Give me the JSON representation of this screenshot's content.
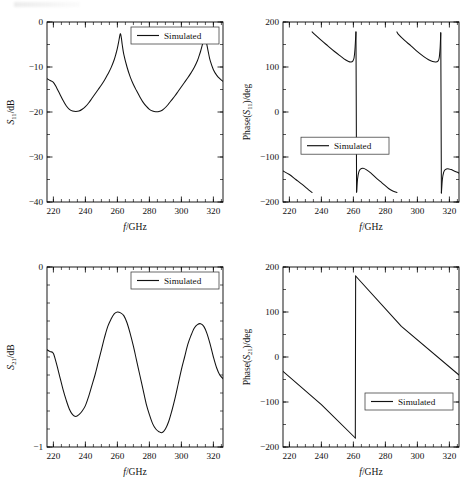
{
  "figure": {
    "panel_count": 4,
    "line_color": "#111111",
    "background": "#ffffff"
  },
  "legend_label": "Simulated",
  "axis_x_label": "f/GHz",
  "chart_data": [
    {
      "id": "s11-magnitude",
      "position": "top-left",
      "type": "line",
      "title": "",
      "xlabel": "f/GHz",
      "ylabel": "S11/dB",
      "ylabel_base": "S",
      "ylabel_sub": "11",
      "ylabel_unit": "/dB",
      "xlim": [
        216,
        326
      ],
      "ylim": [
        -40,
        0
      ],
      "xticks": [
        220,
        240,
        260,
        280,
        300,
        320
      ],
      "yticks": [
        0,
        -10,
        -20,
        -30,
        -40
      ],
      "xminor_step": 5,
      "yminor_step": 5,
      "grid": false,
      "legend": [
        "Simulated"
      ],
      "legend_position": "top-right",
      "series": [
        {
          "name": "Simulated",
          "x": [
            216,
            218,
            220,
            222,
            224,
            226,
            228,
            230,
            232,
            234,
            236,
            238,
            240,
            242,
            244,
            246,
            248,
            250,
            252,
            254,
            256,
            258,
            259,
            260,
            261,
            261.8,
            262.5,
            263,
            264,
            266,
            268,
            270,
            272,
            274,
            276,
            278,
            280,
            282,
            284,
            286,
            288,
            290,
            292,
            294,
            296,
            298,
            300,
            302,
            304,
            306,
            308,
            310,
            311,
            312,
            313,
            314,
            314.8,
            315.5,
            316,
            317,
            318,
            320,
            322,
            324,
            326
          ],
          "y": [
            -12.6,
            -13.0,
            -13.4,
            -14.6,
            -16.0,
            -17.4,
            -18.6,
            -19.4,
            -19.8,
            -19.9,
            -19.8,
            -19.4,
            -18.8,
            -18.0,
            -17.0,
            -16.0,
            -15.0,
            -14.0,
            -12.9,
            -11.6,
            -10.2,
            -8.4,
            -7.2,
            -5.8,
            -4.0,
            -2.6,
            -3.6,
            -5.0,
            -7.2,
            -10.0,
            -12.2,
            -13.9,
            -15.3,
            -16.6,
            -17.8,
            -18.7,
            -19.4,
            -19.8,
            -19.95,
            -19.9,
            -19.6,
            -19.0,
            -18.2,
            -17.3,
            -16.4,
            -15.4,
            -14.4,
            -13.4,
            -12.4,
            -11.3,
            -10.1,
            -8.6,
            -7.6,
            -6.5,
            -5.2,
            -3.9,
            -3.3,
            -4.2,
            -5.2,
            -7.0,
            -8.6,
            -10.6,
            -11.8,
            -12.6,
            -13.2
          ]
        }
      ]
    },
    {
      "id": "s11-phase",
      "position": "top-right",
      "type": "line",
      "title": "",
      "xlabel": "f/GHz",
      "ylabel": "Phase(S11)/deg",
      "ylabel_prefix": "Phase(",
      "ylabel_base": "S",
      "ylabel_sub": "11",
      "ylabel_suffix": ")/deg",
      "xlim": [
        216,
        326
      ],
      "ylim": [
        -200,
        200
      ],
      "xticks": [
        220,
        240,
        260,
        280,
        300,
        320
      ],
      "yticks": [
        200,
        100,
        0,
        -100,
        -200
      ],
      "xminor_step": 5,
      "yminor_step": 50,
      "grid": false,
      "legend": [
        "Simulated"
      ],
      "legend_position": "center-left-lower",
      "branches": [
        {
          "x": [
            216,
            220,
            224,
            228,
            232,
            234.2
          ],
          "y": [
            -131,
            -139,
            -150,
            -161,
            -173,
            -179
          ]
        },
        {
          "x": [
            234.2,
            236,
            240,
            244,
            248,
            252,
            255,
            257,
            258.5,
            259.6,
            260.4,
            261,
            261.6
          ],
          "y": [
            178,
            172,
            159,
            147,
            135,
            124,
            116,
            112,
            111,
            113,
            120,
            140,
            178
          ]
        },
        {
          "x": [
            261.6,
            262.0
          ],
          "y": [
            178,
            -178
          ]
        },
        {
          "x": [
            262.0,
            262.6,
            263.4,
            264.4,
            266,
            268,
            271,
            274,
            278,
            282,
            285,
            287.2
          ],
          "y": [
            -178,
            -149,
            -133,
            -127,
            -125,
            -128,
            -136,
            -146,
            -158,
            -170,
            -176,
            -179
          ]
        },
        {
          "x": [
            287.2,
            288,
            292,
            296,
            300,
            304,
            307,
            309.5,
            311.5,
            312.8,
            313.6,
            314.2,
            314.6
          ],
          "y": [
            178,
            173,
            159,
            147,
            134,
            123,
            116,
            112,
            111,
            113,
            120,
            142,
            176
          ]
        },
        {
          "x": [
            314.6,
            315.0
          ],
          "y": [
            176,
            -180
          ]
        },
        {
          "x": [
            315.0,
            315.6,
            316.4,
            317.4,
            319,
            321,
            323,
            325,
            326
          ],
          "y": [
            -180,
            -150,
            -134,
            -128,
            -126,
            -128,
            -131,
            -134,
            -136
          ]
        }
      ]
    },
    {
      "id": "s21-magnitude",
      "position": "bottom-left",
      "type": "line",
      "title": "",
      "xlabel": "f/GHz",
      "ylabel": "S21/dB",
      "ylabel_base": "S",
      "ylabel_sub": "21",
      "ylabel_unit": "/dB",
      "xlim": [
        216,
        326
      ],
      "ylim": [
        -1,
        0
      ],
      "xticks": [
        220,
        240,
        260,
        280,
        300,
        320
      ],
      "yticks": [
        0,
        -1
      ],
      "xminor_step": 5,
      "yminor_step": 0.1,
      "grid": false,
      "legend": [
        "Simulated"
      ],
      "legend_position": "top-right",
      "series": [
        {
          "name": "Simulated",
          "x": [
            216,
            218,
            220,
            222,
            224,
            226,
            228,
            230,
            232,
            234,
            236,
            238,
            240,
            242,
            244,
            246,
            248,
            250,
            252,
            254,
            256,
            258,
            260,
            262,
            264,
            266,
            268,
            270,
            272,
            274,
            276,
            278,
            280,
            282,
            284,
            286,
            288,
            290,
            292,
            294,
            296,
            298,
            300,
            302,
            304,
            306,
            308,
            310,
            312,
            314,
            316,
            318,
            320,
            322,
            324,
            326
          ],
          "y": [
            -0.46,
            -0.47,
            -0.48,
            -0.54,
            -0.61,
            -0.68,
            -0.74,
            -0.79,
            -0.82,
            -0.83,
            -0.82,
            -0.8,
            -0.77,
            -0.72,
            -0.66,
            -0.6,
            -0.53,
            -0.46,
            -0.39,
            -0.33,
            -0.29,
            -0.26,
            -0.25,
            -0.255,
            -0.27,
            -0.31,
            -0.37,
            -0.44,
            -0.52,
            -0.6,
            -0.68,
            -0.76,
            -0.82,
            -0.87,
            -0.9,
            -0.915,
            -0.92,
            -0.9,
            -0.86,
            -0.8,
            -0.73,
            -0.65,
            -0.57,
            -0.5,
            -0.43,
            -0.38,
            -0.34,
            -0.32,
            -0.315,
            -0.33,
            -0.37,
            -0.43,
            -0.5,
            -0.56,
            -0.6,
            -0.62
          ]
        }
      ]
    },
    {
      "id": "s21-phase",
      "position": "bottom-right",
      "type": "line",
      "title": "",
      "xlabel": "f/GHz",
      "ylabel": "Phase(S21)/deg",
      "ylabel_prefix": "Phase(",
      "ylabel_base": "S",
      "ylabel_sub": "21",
      "ylabel_suffix": ")/deg",
      "xlim": [
        216,
        326
      ],
      "ylim": [
        -200,
        200
      ],
      "xticks": [
        220,
        240,
        260,
        280,
        300,
        320
      ],
      "yticks": [
        200,
        100,
        0,
        -100,
        -200
      ],
      "xminor_step": 5,
      "yminor_step": 50,
      "grid": false,
      "legend": [
        "Simulated"
      ],
      "legend_position": "center-right-lower",
      "branches": [
        {
          "x": [
            216,
            240,
            261.2
          ],
          "y": [
            -32,
            -106,
            -180
          ]
        },
        {
          "x": [
            261.2,
            261.4
          ],
          "y": [
            -180,
            180
          ]
        },
        {
          "x": [
            261.4,
            290,
            326
          ],
          "y": [
            180,
            68,
            -40
          ]
        }
      ]
    }
  ]
}
